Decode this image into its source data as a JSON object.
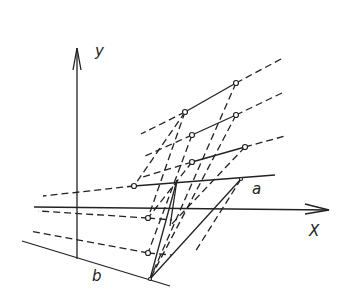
{
  "labels": {
    "y": "y",
    "x": "X",
    "a": "a",
    "b": "b"
  },
  "colors": {
    "ink": "#222222",
    "background": "#ffffff"
  },
  "points": [
    [
      236,
      83
    ],
    [
      185,
      112
    ],
    [
      236,
      115
    ],
    [
      192,
      135
    ],
    [
      245,
      147
    ],
    [
      192,
      162
    ],
    [
      134,
      186
    ],
    [
      148,
      218
    ],
    [
      148,
      253
    ],
    [
      150,
      279
    ],
    [
      241,
      179
    ]
  ]
}
